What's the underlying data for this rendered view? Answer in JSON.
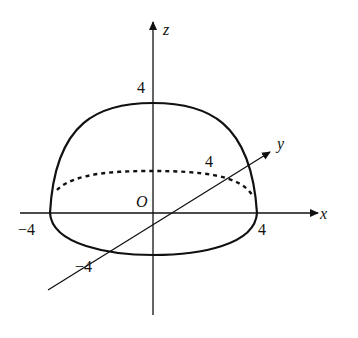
{
  "diagram": {
    "type": "3d-coordinate-sketch",
    "axes": {
      "x": {
        "label": "x",
        "ticks": [
          "-4",
          "4"
        ]
      },
      "y": {
        "label": "y",
        "ticks": [
          "-4",
          "4"
        ]
      },
      "z": {
        "label": "z",
        "ticks": [
          "4"
        ]
      }
    },
    "origin_label": "O",
    "labels": {
      "z_tick": "4",
      "x_neg": "−4",
      "x_pos": "4",
      "y_neg": "−4",
      "y_pos": "4"
    },
    "colors": {
      "stroke": "#111111",
      "background": "#ffffff"
    }
  }
}
